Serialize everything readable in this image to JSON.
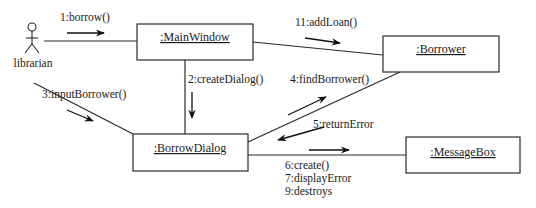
{
  "diagram": {
    "type": "UML collaboration diagram",
    "actor": {
      "name": "librarian"
    },
    "objects": [
      {
        "id": "mainwindow",
        "label": ":MainWindow"
      },
      {
        "id": "borrower",
        "label": ":Borrower"
      },
      {
        "id": "borrowdialog",
        "label": ":BorrowDialog"
      },
      {
        "id": "messagebox",
        "label": ":MessageBox"
      }
    ],
    "messages": {
      "m1": "1:borrow()",
      "m2": "2:createDialog()",
      "m3": "3:inputBorrower()",
      "m4": "4:findBorrower()",
      "m5": "5:returnError",
      "m6": "6:create()",
      "m7": "7:displayError",
      "m9": "9:destroys",
      "m11": "11:addLoan()"
    },
    "links": [
      {
        "from": "librarian",
        "to": "mainwindow",
        "messages": [
          "1:borrow()"
        ]
      },
      {
        "from": "mainwindow",
        "to": "borrowdialog",
        "messages": [
          "2:createDialog()"
        ]
      },
      {
        "from": "librarian",
        "to": "borrowdialog",
        "messages": [
          "3:inputBorrower()"
        ]
      },
      {
        "from": "borrowdialog",
        "to": "borrower",
        "messages": [
          "4:findBorrower()"
        ]
      },
      {
        "from": "borrower",
        "to": "borrowdialog",
        "messages": [
          "5:returnError"
        ]
      },
      {
        "from": "borrowdialog",
        "to": "messagebox",
        "messages": [
          "6:create()",
          "7:displayError",
          "9:destroys"
        ]
      },
      {
        "from": "mainwindow",
        "to": "borrower",
        "messages": [
          "11:addLoan()"
        ]
      }
    ],
    "colors": {
      "line": "#2a2a2a",
      "background": "#ffffff",
      "text": "#1a1a1a"
    }
  }
}
